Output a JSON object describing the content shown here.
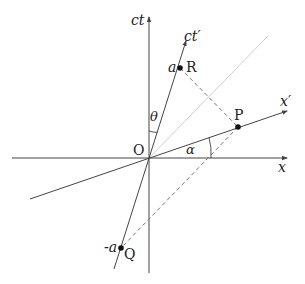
{
  "diagram": {
    "type": "spacetime-minkowski",
    "axes": {
      "ct": "ct",
      "x": "x",
      "ct_prime": "ct′",
      "x_prime": "x′"
    },
    "origin_label": "O",
    "angles": {
      "theta": "θ",
      "alpha": "α"
    },
    "points": {
      "R": {
        "label": "R",
        "coord_label": "a"
      },
      "P": {
        "label": "P"
      },
      "Q": {
        "label": "Q",
        "coord_label": "-a"
      }
    },
    "colors": {
      "axis": "#444444",
      "light_cone": "#cccccc",
      "dashed": "#777777",
      "point": "#111111"
    }
  }
}
